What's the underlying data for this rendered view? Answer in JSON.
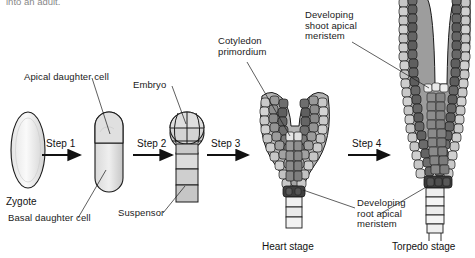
{
  "figure": {
    "title_fragment": "into an adult.",
    "background": "#ffffff",
    "ink": "#1a1a1a"
  },
  "palette": {
    "cell_light": "#d8d8d8",
    "cell_mid": "#a8a8a8",
    "cell_dark": "#6e6e6e",
    "cell_darkest": "#4a4a4a",
    "outline": "#1a1a1a",
    "zygote_fill": "#f2f2f2"
  },
  "steps": [
    {
      "id": "step-1",
      "label": "Step 1"
    },
    {
      "id": "step-2",
      "label": "Step 2"
    },
    {
      "id": "step-3",
      "label": "Step 3"
    },
    {
      "id": "step-4",
      "label": "Step 4"
    }
  ],
  "stages": [
    {
      "id": "zygote",
      "caption": "Zygote"
    },
    {
      "id": "heart",
      "caption": "Heart stage"
    },
    {
      "id": "torpedo",
      "caption": "Torpedo stage"
    }
  ],
  "annotations": [
    {
      "id": "apical-daughter-cell",
      "text": "Apical daughter cell"
    },
    {
      "id": "basal-daughter-cell",
      "text": "Basal daughter cell"
    },
    {
      "id": "embryo",
      "text": "Embryo"
    },
    {
      "id": "suspensor",
      "text": "Suspensor"
    },
    {
      "id": "cotyledon-primordium",
      "text": "Cotyledon\nprimordium"
    },
    {
      "id": "shoot-apical-meristem",
      "text": "Developing\nshoot apical\nmeristem"
    },
    {
      "id": "root-apical-meristem",
      "text": "Developing\nroot apical\nmeristem"
    }
  ]
}
